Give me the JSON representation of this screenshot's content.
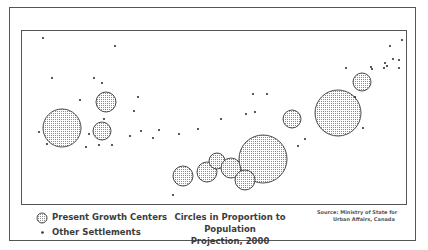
{
  "map": {
    "title_line1": "Circles in Proportion to Population",
    "title_line2": "Projection, 2000",
    "source_line1": "Source: Ministry of State for",
    "source_line2": "Urban Affairs, Canada",
    "colors": {
      "stroke": "#4a4a4a",
      "fill": "#c8c8c8",
      "dot": "#333333",
      "border": "#555555"
    }
  },
  "legend": {
    "items": [
      {
        "icon": "dotted-circle-icon",
        "label": "Present Growth Centers"
      },
      {
        "icon": "dot-icon",
        "label": "Other Settlements"
      }
    ]
  },
  "growth_centers": [
    {
      "x": 61,
      "y": 127,
      "r": 19
    },
    {
      "x": 105,
      "y": 101,
      "r": 10
    },
    {
      "x": 101,
      "y": 130,
      "r": 9
    },
    {
      "x": 182,
      "y": 175,
      "r": 10
    },
    {
      "x": 206,
      "y": 171,
      "r": 10
    },
    {
      "x": 216,
      "y": 160,
      "r": 8
    },
    {
      "x": 230,
      "y": 167,
      "r": 10
    },
    {
      "x": 262,
      "y": 158,
      "r": 24
    },
    {
      "x": 244,
      "y": 179,
      "r": 10
    },
    {
      "x": 291,
      "y": 118,
      "r": 9
    },
    {
      "x": 337,
      "y": 112,
      "r": 23
    },
    {
      "x": 361,
      "y": 81,
      "r": 9
    }
  ],
  "settlements": [
    [
      42,
      37
    ],
    [
      114,
      45
    ],
    [
      51,
      77
    ],
    [
      93,
      77
    ],
    [
      101,
      82
    ],
    [
      79,
      99
    ],
    [
      137,
      96
    ],
    [
      133,
      110
    ],
    [
      103,
      118
    ],
    [
      88,
      133
    ],
    [
      38,
      131
    ],
    [
      46,
      143
    ],
    [
      85,
      146
    ],
    [
      98,
      144
    ],
    [
      111,
      144
    ],
    [
      129,
      135
    ],
    [
      140,
      130
    ],
    [
      152,
      137
    ],
    [
      158,
      129
    ],
    [
      178,
      133
    ],
    [
      197,
      128
    ],
    [
      220,
      118
    ],
    [
      245,
      113
    ],
    [
      252,
      93
    ],
    [
      266,
      93
    ],
    [
      254,
      111
    ],
    [
      172,
      194
    ],
    [
      297,
      145
    ],
    [
      304,
      138
    ],
    [
      362,
      127
    ],
    [
      354,
      96
    ],
    [
      345,
      67
    ],
    [
      370,
      66
    ],
    [
      371,
      68
    ],
    [
      401,
      39
    ],
    [
      389,
      45
    ],
    [
      392,
      58
    ],
    [
      384,
      62
    ],
    [
      386,
      65
    ],
    [
      398,
      59
    ],
    [
      398,
      67
    ],
    [
      383,
      67
    ]
  ]
}
